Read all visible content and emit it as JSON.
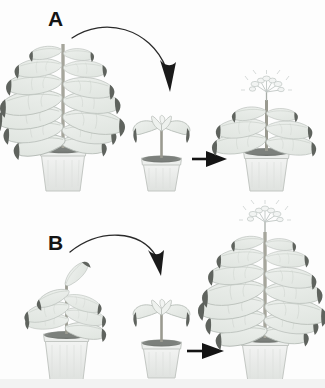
{
  "figure": {
    "title_present": false,
    "background_color": "#ffffff",
    "panels": [
      {
        "id": "A",
        "label": "A",
        "label_position": {
          "x": 48,
          "y": 8
        },
        "description": "Large leafy donor plant, curved transfer arrow, small recipient plant, straight arrow, small flowering plant",
        "items": [
          {
            "role": "donor-plant",
            "name": "large-donor-plant",
            "size": "large",
            "leaf_count": 14,
            "flowering": false,
            "x": 8,
            "y": 28,
            "width": 108,
            "height": 166
          },
          {
            "role": "transfer-arrow",
            "name": "curved-transfer-arrow",
            "shape": "curved",
            "direction": "down-right"
          },
          {
            "role": "recipient-plant",
            "name": "small-recipient-plant",
            "size": "small",
            "leaf_count": 5,
            "flowering": false,
            "x": 131,
            "y": 112,
            "width": 60,
            "height": 82
          },
          {
            "role": "result-arrow",
            "name": "straight-result-arrow",
            "shape": "straight",
            "direction": "right"
          },
          {
            "role": "result-plant",
            "name": "small-flowering-result-plant",
            "size": "small",
            "leaf_count": 6,
            "flowering": true,
            "x": 231,
            "y": 84,
            "width": 78,
            "height": 110
          }
        ]
      },
      {
        "id": "B",
        "label": "B",
        "label_position": {
          "x": 48,
          "y": 232
        },
        "description": "Medium donor plant, curved transfer arrow, small recipient plant, straight arrow, large flowering plant",
        "items": [
          {
            "role": "donor-plant",
            "name": "medium-donor-plant",
            "size": "medium",
            "leaf_count": 7,
            "flowering": false,
            "x": 26,
            "y": 268,
            "width": 78,
            "height": 114
          },
          {
            "role": "transfer-arrow",
            "name": "curved-transfer-arrow",
            "shape": "curved",
            "direction": "down-right"
          },
          {
            "role": "recipient-plant",
            "name": "small-recipient-plant",
            "size": "small",
            "leaf_count": 5,
            "flowering": false,
            "x": 131,
            "y": 304,
            "width": 60,
            "height": 80
          },
          {
            "role": "result-arrow",
            "name": "straight-result-arrow",
            "shape": "straight",
            "direction": "right"
          },
          {
            "role": "result-plant",
            "name": "large-flowering-result-plant",
            "size": "large",
            "leaf_count": 14,
            "flowering": true,
            "x": 207,
            "y": 206,
            "width": 112,
            "height": 178
          }
        ]
      }
    ]
  },
  "colors": {
    "leaf_fill": "#e4e8e4",
    "leaf_fill_light": "#eef1ee",
    "leaf_stroke": "#b7bdb8",
    "leaf_vein": "#c6ccc6",
    "leaf_tip": "#5f635e",
    "stem": "#9a9a90",
    "stem_dark": "#7d7d74",
    "pot_fill": "#e8eae8",
    "pot_fill_light": "#f4f5f4",
    "pot_stroke": "#c3c7c3",
    "soil": "#8d918d",
    "soil_dark": "#6f736f",
    "flower": "#f2f4f3",
    "flower_stroke": "#c0c6c4",
    "arrow": "#1a1a1a",
    "label": "#141414",
    "background": "#ffffff",
    "footer_band": "#f2f3f2"
  }
}
